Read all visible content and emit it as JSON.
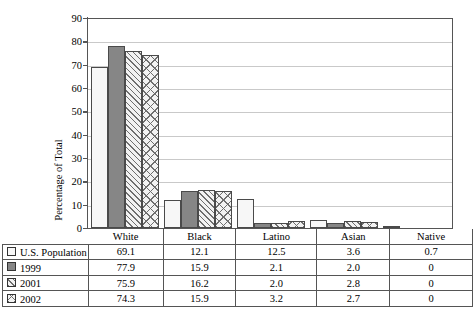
{
  "chart_data": {
    "type": "bar",
    "title": "",
    "xlabel": "",
    "ylabel": "Percentage of Total",
    "ylim": [
      0,
      90
    ],
    "ytick_step": 10,
    "yticks": [
      0,
      10,
      20,
      30,
      40,
      50,
      60,
      70,
      80,
      90
    ],
    "grid": true,
    "legend_position": "table-below",
    "categories": [
      "White",
      "Black",
      "Latino",
      "Asian",
      "Native"
    ],
    "series": [
      {
        "name": "U.S. Population",
        "pattern": "empty-white",
        "values": [
          69.1,
          12.1,
          12.5,
          3.6,
          0.7
        ]
      },
      {
        "name": "1999",
        "pattern": "solid-gray",
        "values": [
          77.9,
          15.9,
          2.1,
          2.0,
          0
        ]
      },
      {
        "name": "2001",
        "pattern": "diagonal-hatch",
        "values": [
          75.9,
          16.2,
          2.0,
          2.8,
          0
        ]
      },
      {
        "name": "2002",
        "pattern": "cross-hatch",
        "values": [
          74.3,
          15.9,
          3.2,
          2.7,
          0
        ]
      }
    ]
  },
  "table": {
    "row_header_blank": "",
    "column_headers": [
      "White",
      "Black",
      "Latino",
      "Asian",
      "Native"
    ],
    "rows": [
      {
        "label": "U.S. Population",
        "cells": [
          "69.1",
          "12.1",
          "12.5",
          "3.6",
          "0.7"
        ]
      },
      {
        "label": "1999",
        "cells": [
          "77.9",
          "15.9",
          "2.1",
          "2.0",
          "0"
        ]
      },
      {
        "label": "2001",
        "cells": [
          "75.9",
          "16.2",
          "2.0",
          "2.8",
          "0"
        ]
      },
      {
        "label": "2002",
        "cells": [
          "74.3",
          "15.9",
          "3.2",
          "2.7",
          "0"
        ]
      }
    ]
  },
  "colors": {
    "axis": "#555555",
    "gridline": "#c9c9c9",
    "bar_outline": "#4a4a4a",
    "series_empty": "#f7f7f7",
    "series_solid": "#868686",
    "hatch": "#6e6e6e",
    "background": "#ffffff"
  }
}
